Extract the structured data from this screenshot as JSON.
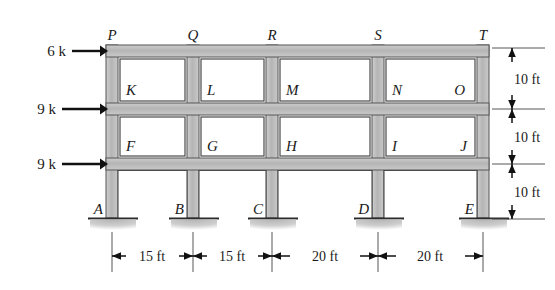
{
  "figure": {
    "type": "structural-frame-diagram",
    "colors": {
      "member_fill": "#b9b9b9",
      "member_fill_light": "#d2d2d2",
      "member_stroke": "#4a4a4a",
      "ink": "#1a1a1a",
      "ground_hatch": "#9a9a9a"
    }
  },
  "loads": [
    {
      "label": "6 k",
      "level": "roof"
    },
    {
      "label": "9 k",
      "level": "third-floor"
    },
    {
      "label": "9 k",
      "level": "second-floor"
    }
  ],
  "joints_top": [
    {
      "label": "P"
    },
    {
      "label": "Q"
    },
    {
      "label": "R"
    },
    {
      "label": "S"
    },
    {
      "label": "T"
    }
  ],
  "supports": [
    {
      "label": "A"
    },
    {
      "label": "B"
    },
    {
      "label": "C"
    },
    {
      "label": "D"
    },
    {
      "label": "E"
    }
  ],
  "members_upper_story": [
    {
      "label": "K"
    },
    {
      "label": "L"
    },
    {
      "label": "M"
    },
    {
      "label": "N"
    },
    {
      "label": "O"
    }
  ],
  "members_middle_story": [
    {
      "label": "F"
    },
    {
      "label": "G"
    },
    {
      "label": "H"
    },
    {
      "label": "I"
    },
    {
      "label": "J"
    }
  ],
  "bay_dimensions": [
    {
      "label": "15 ft"
    },
    {
      "label": "15 ft"
    },
    {
      "label": "20 ft"
    },
    {
      "label": "20 ft"
    }
  ],
  "story_heights": [
    {
      "label": "10 ft"
    },
    {
      "label": "10 ft"
    },
    {
      "label": "10 ft"
    }
  ]
}
